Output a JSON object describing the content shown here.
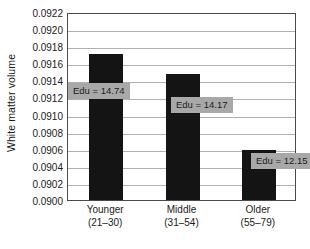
{
  "chart_data": {
    "type": "bar",
    "title": "",
    "xlabel": "",
    "ylabel": "White matter volume",
    "categories": [
      "Younger",
      "Middle",
      "Older"
    ],
    "category_sublabels": [
      "(21–30)",
      "(31–54)",
      "(55–79)"
    ],
    "values": [
      0.09171,
      0.09148,
      0.09059
    ],
    "ylim": [
      0.09,
      0.0922
    ],
    "ytick_step": 0.0002,
    "ytick_labels": [
      "0.0922",
      "0.0920",
      "0.0918",
      "0.0916",
      "0.0914",
      "0.0912",
      "0.0910",
      "0.0908",
      "0.0906",
      "0.0904",
      "0.0902",
      "0.0900"
    ],
    "ytick_values": [
      0.0922,
      0.092,
      0.0918,
      0.0916,
      0.0914,
      0.0912,
      0.091,
      0.0908,
      0.0906,
      0.0904,
      0.0902,
      0.09
    ],
    "grid": true,
    "legend": "none",
    "annotations": [
      {
        "text": "Edu = 14.74",
        "series_index": 0,
        "value": 14.74
      },
      {
        "text": "Edu = 14.17",
        "series_index": 1,
        "value": 14.17
      },
      {
        "text": "Edu = 12.15",
        "series_index": 2,
        "value": 12.15
      }
    ],
    "colors": {
      "bar": "#141414",
      "annotation_box": "#a8a8a8",
      "gridline": "#b0b0b0",
      "axis": "#4a4a4a",
      "background": "#ffffff",
      "text": "#1a1a1a"
    }
  }
}
